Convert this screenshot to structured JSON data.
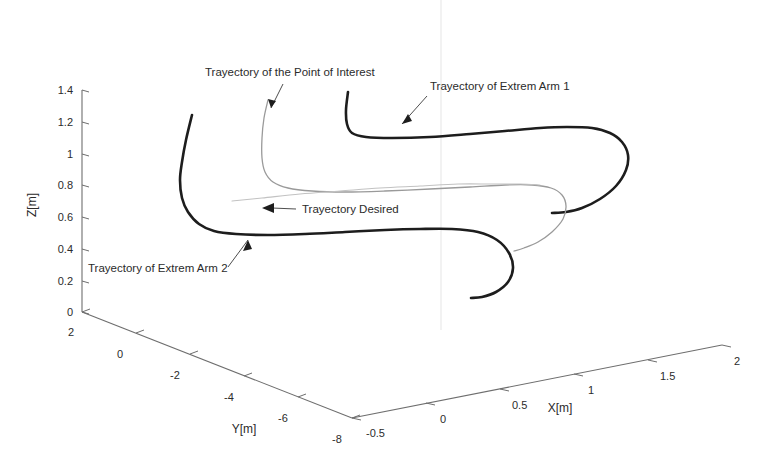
{
  "figure": {
    "type": "3d-line-plot",
    "background_color": "#ffffff",
    "scan_artifact": {
      "present": true,
      "color": "#ececec",
      "x": 441
    }
  },
  "axes": {
    "z": {
      "label": "Z[m]",
      "ticks": [
        "0",
        "0.2",
        "0.4",
        "0.6",
        "0.8",
        "1",
        "1.2",
        "1.4"
      ],
      "range": [
        0,
        1.4
      ],
      "color": "#6e6e6e"
    },
    "y": {
      "label": "Y[m]",
      "ticks": [
        "2",
        "0",
        "-2",
        "-4",
        "-6",
        "-8"
      ],
      "range": [
        2,
        -8
      ],
      "color": "#6e6e6e"
    },
    "x": {
      "label": "X[m]",
      "ticks": [
        "-0.5",
        "0",
        "0.5",
        "1",
        "1.5",
        "2"
      ],
      "range": [
        -0.5,
        2
      ],
      "color": "#6e6e6e"
    }
  },
  "annotations": [
    {
      "id": "point-of-interest",
      "text": "Trayectory of the Point of Interest"
    },
    {
      "id": "extrem-arm-1",
      "text": "Trayectory of Extrem Arm 1"
    },
    {
      "id": "trayectory-desired",
      "text": "Trayectory Desired"
    },
    {
      "id": "extrem-arm-2",
      "text": "Trayectory of Extrem Arm 2"
    }
  ],
  "chart_data": {
    "type": "line",
    "title": "",
    "xlabel": "X[m]",
    "ylabel": "Y[m]",
    "zlabel": "Z[m]",
    "xlim": [
      -0.5,
      2
    ],
    "ylim": [
      -8,
      2
    ],
    "zlim": [
      0,
      1.4
    ],
    "grid": false,
    "legend": "none (curves labeled by in-figure annotations)",
    "projection": "3d",
    "series": [
      {
        "name": "Trayectory of Extrem Arm 1",
        "color": "#1d1d1d",
        "width": 2.6,
        "note": "Upper dark curve; starts high at Z~1.35, sharp elbow down, runs right at Z~1.15, hooks back left ending near Z~0.80",
        "points_px": [
          [
            348,
            92
          ],
          [
            346,
            110
          ],
          [
            347,
            124
          ],
          [
            352,
            133
          ],
          [
            366,
            137
          ],
          [
            392,
            138
          ],
          [
            430,
            137
          ],
          [
            470,
            134
          ],
          [
            505,
            131
          ],
          [
            540,
            128
          ],
          [
            567,
            127
          ],
          [
            592,
            128
          ],
          [
            610,
            133
          ],
          [
            622,
            142
          ],
          [
            628,
            155
          ],
          [
            626,
            170
          ],
          [
            616,
            186
          ],
          [
            600,
            199
          ],
          [
            582,
            208
          ],
          [
            566,
            212
          ],
          [
            552,
            213
          ]
        ]
      },
      {
        "name": "Trayectory of the Point of Interest",
        "color": "#9a9a9a",
        "width": 1.3,
        "note": "Light thin curve; descends from Z~1.32 at left, bends right around Z~0.86, sweeps right then hooks back down-left ending near Z~0.67",
        "points_px": [
          [
            268,
            100
          ],
          [
            264,
            118
          ],
          [
            262,
            138
          ],
          [
            262,
            158
          ],
          [
            265,
            172
          ],
          [
            273,
            182
          ],
          [
            288,
            188
          ],
          [
            312,
            191
          ],
          [
            345,
            192
          ],
          [
            385,
            191
          ],
          [
            430,
            189
          ],
          [
            470,
            187
          ],
          [
            505,
            185
          ],
          [
            532,
            185
          ],
          [
            551,
            188
          ],
          [
            562,
            195
          ],
          [
            566,
            206
          ],
          [
            563,
            219
          ],
          [
            552,
            232
          ],
          [
            538,
            242
          ],
          [
            524,
            248
          ],
          [
            514,
            251
          ]
        ]
      },
      {
        "name": "Trayectory Desired",
        "color": "#c2c2c2",
        "width": 1.1,
        "note": "Very faint thin reference line from mid-left rising gently to the right, merging toward the point-of-interest path",
        "points_px": [
          [
            232,
            201
          ],
          [
            262,
            198
          ],
          [
            300,
            194
          ],
          [
            340,
            191
          ],
          [
            380,
            188
          ],
          [
            420,
            186
          ],
          [
            458,
            184
          ],
          [
            492,
            184
          ],
          [
            520,
            184
          ],
          [
            540,
            185
          ]
        ]
      },
      {
        "name": "Trayectory of Extrem Arm 2",
        "color": "#1d1d1d",
        "width": 2.6,
        "note": "Lower dark curve; starts at Z~1.21 upper-left, drops steeply, flattens at Z~0.50, runs right then hooks back down-left ending near Z~0.20",
        "points_px": [
          [
            192,
            115
          ],
          [
            186,
            140
          ],
          [
            182,
            162
          ],
          [
            180,
            180
          ],
          [
            182,
            198
          ],
          [
            188,
            212
          ],
          [
            199,
            224
          ],
          [
            214,
            231
          ],
          [
            236,
            234
          ],
          [
            268,
            235
          ],
          [
            305,
            234
          ],
          [
            345,
            232
          ],
          [
            385,
            230
          ],
          [
            420,
            229
          ],
          [
            452,
            229
          ],
          [
            478,
            232
          ],
          [
            497,
            240
          ],
          [
            509,
            253
          ],
          [
            513,
            268
          ],
          [
            508,
            282
          ],
          [
            496,
            292
          ],
          [
            482,
            297
          ],
          [
            471,
            298
          ]
        ]
      }
    ]
  }
}
